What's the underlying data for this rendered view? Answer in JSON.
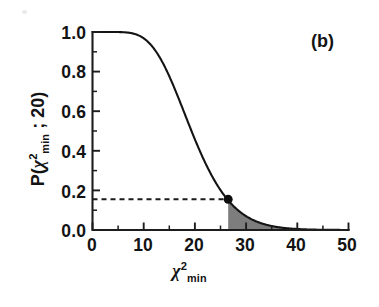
{
  "panel": {
    "label": "(b)"
  },
  "axes": {
    "x_title_base": "χ",
    "x_title_sup": "2",
    "x_title_sub": "min",
    "y_title_prefix": "P(",
    "y_title_base": "χ",
    "y_title_sup": "2",
    "y_title_sub": "min",
    "y_title_sep": " ; ",
    "y_title_dof": "20",
    "y_title_suffix": ")",
    "x_ticks": [
      "0",
      "10",
      "20",
      "30",
      "40",
      "50"
    ],
    "y_ticks": [
      "1.0",
      "0.8",
      "0.6",
      "0.4",
      "0.2",
      "0.0"
    ]
  },
  "annotation": {
    "marker_x": "26.5",
    "marker_y": "0.155"
  },
  "colors": {
    "axis": "#1d1d1d",
    "curve": "#141414",
    "tail_fill": "#7d7d7d",
    "marker": "#0d0d0d",
    "dash": "#1b1b1b",
    "background": "#ffffff"
  },
  "chart_data": {
    "type": "line",
    "title": "",
    "subtitle": "",
    "panel_label": "(b)",
    "xlabel": "chi^2_min",
    "ylabel": "P(chi^2_min ; 20)",
    "xlim": [
      0,
      50
    ],
    "ylim": [
      0.0,
      1.0
    ],
    "grid": false,
    "legend": null,
    "x_major_ticks": [
      0,
      10,
      20,
      30,
      40,
      50
    ],
    "x_minor_ticks": [
      5,
      15,
      25,
      35,
      45
    ],
    "y_major_ticks": [
      0.0,
      0.2,
      0.4,
      0.6,
      0.8,
      1.0
    ],
    "y_minor_ticks": [
      0.1,
      0.3,
      0.5,
      0.7,
      0.9
    ],
    "series": [
      {
        "name": "P(chi^2_min ; 20)",
        "type": "line",
        "color": "#141414",
        "x": [
          0,
          1,
          2,
          3,
          4,
          5,
          6,
          7,
          8,
          9,
          10,
          11,
          12,
          13,
          14,
          15,
          16,
          17,
          18,
          19,
          20,
          21,
          22,
          23,
          24,
          25,
          26,
          26.5,
          27,
          28,
          29,
          30,
          31,
          32,
          33,
          34,
          35,
          36,
          37,
          38,
          39,
          40,
          41,
          42,
          43,
          44,
          45,
          46,
          47,
          48,
          49,
          50
        ],
        "y": [
          1.0,
          1.0,
          1.0,
          1.0,
          1.0,
          0.9999,
          0.9997,
          0.9992,
          0.9979,
          0.9953,
          0.9682,
          0.9526,
          0.9161,
          0.8614,
          0.7916,
          0.7166,
          0.6272,
          0.5544,
          0.5858,
          0.4648,
          0.4579,
          0.3918,
          0.3405,
          0.2888,
          0.2424,
          0.2018,
          0.167,
          0.152,
          0.1374,
          0.1118,
          0.0903,
          0.0723,
          0.0576,
          0.0454,
          0.0356,
          0.0277,
          0.0214,
          0.0165,
          0.0126,
          0.0096,
          0.0073,
          0.0055,
          0.0041,
          0.003,
          0.0022,
          0.0017,
          0.0012,
          0.0009,
          0.0007,
          0.0005,
          0.0004,
          0.0003
        ]
      }
    ],
    "shaded_region": {
      "label": "upper tail area",
      "x_start": 26.5,
      "x_end": 50,
      "fill_color": "#7d7d7d",
      "bounded_above_by": "curve",
      "bounded_below_by": "y=0"
    },
    "markers": [
      {
        "name": "critical-point",
        "x": 26.5,
        "y": 0.155,
        "shape": "circle",
        "color": "#0d0d0d",
        "size": 9
      }
    ],
    "reference_lines": [
      {
        "name": "probability-guide",
        "orientation": "horizontal",
        "y": 0.155,
        "x_from": 0,
        "x_to": 26.5,
        "style": "dashed",
        "color": "#1b1b1b"
      }
    ]
  }
}
